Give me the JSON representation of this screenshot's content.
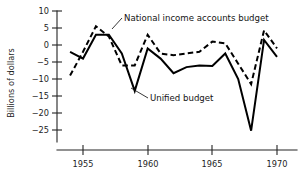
{
  "figure": {
    "ylabel": "Billions of dollars",
    "xlabel": ""
  },
  "annotations": {
    "national": "National income accounts budget",
    "unified": "Unified budget"
  },
  "axis": {
    "y_ticks": [
      "10",
      "5",
      "0",
      "−5",
      "−10",
      "−15",
      "−20",
      "−25"
    ],
    "x_ticks": [
      "1955",
      "1960",
      "1965",
      "1970"
    ]
  },
  "chart_data": {
    "type": "line",
    "title": "",
    "xlabel": "",
    "ylabel": "Billions of dollars",
    "xlim": [
      1953.6,
      1970.2
    ],
    "ylim": [
      -27.5,
      11.0
    ],
    "xticks": [
      1955,
      1960,
      1965,
      1970
    ],
    "yticks": [
      10,
      5,
      0,
      -5,
      -10,
      -15,
      -20,
      -25
    ],
    "grid": false,
    "legend": "inline-annotations",
    "x": [
      1954,
      1955,
      1956,
      1957,
      1958,
      1959,
      1960,
      1961,
      1962,
      1963,
      1964,
      1965,
      1966,
      1967,
      1968,
      1969,
      1970
    ],
    "series": [
      {
        "name": "National income accounts budget",
        "style": "dashed",
        "values": [
          -9.0,
          -2.0,
          5.5,
          2.5,
          -6.0,
          -6.0,
          3.0,
          -2.5,
          -3.0,
          -2.5,
          -2.0,
          1.0,
          0.5,
          -5.5,
          -11.5,
          4.3,
          -1.0
        ]
      },
      {
        "name": "Unified budget",
        "style": "solid",
        "values": [
          -2.0,
          -4.0,
          3.0,
          3.0,
          -2.5,
          -13.5,
          -1.0,
          -4.0,
          -8.3,
          -6.5,
          -6.0,
          -6.2,
          -2.5,
          -10.0,
          -25.2,
          1.5,
          -3.5
        ]
      }
    ]
  }
}
